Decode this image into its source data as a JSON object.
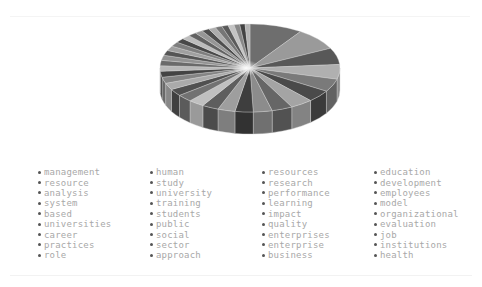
{
  "chart_data": {
    "type": "pie",
    "style": "3d",
    "title": "",
    "legend_position": "bottom",
    "legend_columns": 4,
    "categories": [
      "management",
      "resource",
      "analysis",
      "system",
      "based",
      "universities",
      "career",
      "practices",
      "role",
      "human",
      "study",
      "university",
      "training",
      "students",
      "public",
      "social",
      "sector",
      "approach",
      "resources",
      "research",
      "performance",
      "learning",
      "impact",
      "quality",
      "enterprises",
      "enterprise",
      "business",
      "education",
      "development",
      "employees",
      "model",
      "organizational",
      "evaluation",
      "job",
      "institutions",
      "health"
    ],
    "values": [
      14,
      12,
      9,
      8,
      7,
      6.5,
      6,
      5.5,
      5,
      4.8,
      4.6,
      4.4,
      4.2,
      4,
      3.8,
      3.6,
      3.4,
      3.2,
      3,
      2.9,
      2.8,
      2.7,
      2.6,
      2.5,
      2.4,
      2.3,
      2.2,
      2.1,
      2,
      1.9,
      1.8,
      1.7,
      1.6,
      1.5,
      1.4,
      1.3
    ],
    "colors": [
      "#6e6e6e",
      "#9a9a9a",
      "#585858",
      "#b0b0b0",
      "#7a7a7a",
      "#4a4a4a",
      "#a4a4a4",
      "#666666",
      "#8c8c8c",
      "#3e3e3e",
      "#9e9e9e",
      "#5e5e5e",
      "#c0c0c0",
      "#727272",
      "#505050",
      "#aaaaaa",
      "#848484",
      "#444444",
      "#b8b8b8",
      "#6a6a6a",
      "#929292",
      "#555555",
      "#a0a0a0",
      "#7e7e7e",
      "#484848",
      "#bcbcbc",
      "#626262",
      "#969696",
      "#4e4e4e",
      "#acacac",
      "#767676",
      "#5a5a5a",
      "#c4c4c4",
      "#888888",
      "#424242",
      "#b4b4b4"
    ]
  },
  "legend": {
    "items": [
      "management",
      "human",
      "resources",
      "education",
      "resource",
      "study",
      "research",
      "development",
      "analysis",
      "university",
      "performance",
      "employees",
      "system",
      "training",
      "learning",
      "model",
      "based",
      "students",
      "impact",
      "organizational",
      "universities",
      "public",
      "quality",
      "evaluation",
      "career",
      "social",
      "enterprises",
      "job",
      "practices",
      "sector",
      "enterprise",
      "institutions",
      "role",
      "approach",
      "business",
      "health"
    ]
  }
}
